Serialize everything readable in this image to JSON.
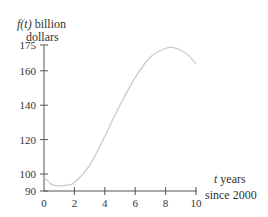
{
  "chart_data": {
    "type": "line",
    "title": "",
    "ylabel_line1_fn": "f(t)",
    "ylabel_line1_rest": " billion",
    "ylabel_line2": "dollars",
    "xlabel_line1_var": "t",
    "xlabel_line1_rest": " years",
    "xlabel_line2": "since 2000",
    "xlim": [
      0,
      10
    ],
    "ylim": [
      90,
      175
    ],
    "x_ticks": [
      "0",
      "2",
      "4",
      "6",
      "8",
      "10"
    ],
    "y_ticks": [
      "90",
      "100",
      "120",
      "140",
      "160",
      "175"
    ],
    "grid": false,
    "series": [
      {
        "name": "f(t)",
        "x": [
          0,
          0.5,
          1,
          1.5,
          2,
          3,
          4,
          5,
          6,
          7,
          8,
          8.5,
          9,
          9.5,
          10
        ],
        "values": [
          98,
          94,
          93,
          93.5,
          95,
          105,
          122,
          140,
          156,
          168,
          173,
          173.5,
          172,
          169,
          164
        ]
      }
    ],
    "line_color": "#c8c8c8"
  }
}
